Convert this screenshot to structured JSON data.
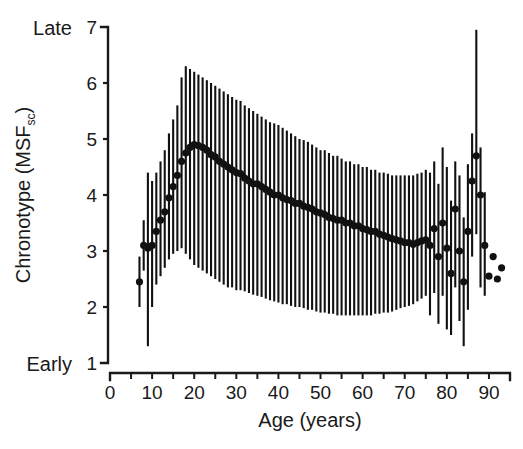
{
  "figure": {
    "background_color": "#ffffff",
    "ink_color": "#111111"
  },
  "axes": {
    "y": {
      "label_main": "Chronotype (MSF",
      "label_sub": "sc",
      "label_close": ")",
      "ticks": [
        1,
        2,
        3,
        4,
        5,
        6,
        7
      ],
      "tick_labels": [
        "1",
        "2",
        "3",
        "4",
        "5",
        "6",
        "7"
      ],
      "range": [
        1,
        7
      ],
      "end_label_high": "Late",
      "end_label_low": "Early"
    },
    "x": {
      "label": "Age (years)",
      "ticks": [
        0,
        10,
        20,
        30,
        40,
        50,
        60,
        70,
        80,
        90
      ],
      "tick_labels": [
        "0",
        "10",
        "20",
        "30",
        "40",
        "50",
        "60",
        "70",
        "80",
        "90"
      ],
      "minor_tick_step": 5,
      "range": [
        0,
        95
      ]
    }
  },
  "chart_data": {
    "type": "scatter",
    "title": "",
    "xlabel": "Age (years)",
    "ylabel": "Chronotype (MSFsc)",
    "xlim": [
      0,
      95
    ],
    "ylim": [
      1,
      7
    ],
    "grid": false,
    "legend": "none",
    "marker": "filled-circle",
    "error_bar_style": "vertical-line",
    "annotations": [
      "Late",
      "Early"
    ],
    "x": [
      7,
      8,
      9,
      10,
      11,
      12,
      13,
      14,
      15,
      16,
      17,
      18,
      19,
      20,
      21,
      22,
      23,
      24,
      25,
      26,
      27,
      28,
      29,
      30,
      31,
      32,
      33,
      34,
      35,
      36,
      37,
      38,
      39,
      40,
      41,
      42,
      43,
      44,
      45,
      46,
      47,
      48,
      49,
      50,
      51,
      52,
      53,
      54,
      55,
      56,
      57,
      58,
      59,
      60,
      61,
      62,
      63,
      64,
      65,
      66,
      67,
      68,
      69,
      70,
      71,
      72,
      73,
      74,
      75,
      76,
      77,
      78,
      79,
      80,
      81,
      82,
      83,
      84,
      85,
      86,
      87,
      88,
      89,
      90,
      91,
      92,
      93
    ],
    "y": [
      2.45,
      3.1,
      3.05,
      3.1,
      3.35,
      3.55,
      3.7,
      3.95,
      4.15,
      4.35,
      4.6,
      4.75,
      4.85,
      4.9,
      4.88,
      4.85,
      4.8,
      4.72,
      4.68,
      4.6,
      4.55,
      4.5,
      4.45,
      4.4,
      4.38,
      4.3,
      4.25,
      4.2,
      4.2,
      4.15,
      4.1,
      4.05,
      4.0,
      4.0,
      3.95,
      3.92,
      3.9,
      3.85,
      3.85,
      3.8,
      3.78,
      3.75,
      3.7,
      3.68,
      3.65,
      3.6,
      3.58,
      3.55,
      3.55,
      3.5,
      3.5,
      3.45,
      3.45,
      3.4,
      3.38,
      3.35,
      3.35,
      3.3,
      3.28,
      3.25,
      3.22,
      3.2,
      3.18,
      3.15,
      3.15,
      3.12,
      3.15,
      3.18,
      3.2,
      3.1,
      3.4,
      2.9,
      3.5,
      3.05,
      2.6,
      3.75,
      3.0,
      2.45,
      3.35,
      4.25,
      4.7,
      4.0,
      3.1,
      2.55,
      2.9,
      2.5,
      2.7
    ],
    "y_err_low": [
      2.0,
      2.65,
      1.3,
      2.0,
      2.4,
      2.55,
      2.7,
      2.85,
      2.95,
      3.0,
      3.05,
      2.95,
      2.85,
      2.75,
      2.7,
      2.65,
      2.6,
      2.55,
      2.5,
      2.45,
      2.4,
      2.35,
      2.35,
      2.3,
      2.3,
      2.28,
      2.25,
      2.22,
      2.2,
      2.18,
      2.15,
      2.12,
      2.1,
      2.08,
      2.05,
      2.05,
      2.02,
      2.0,
      2.0,
      1.98,
      1.95,
      1.95,
      1.92,
      1.9,
      1.9,
      1.88,
      1.88,
      1.85,
      1.85,
      1.85,
      1.85,
      1.85,
      1.85,
      1.85,
      1.85,
      1.85,
      1.88,
      1.88,
      1.9,
      1.9,
      1.92,
      1.95,
      1.98,
      2.0,
      2.02,
      2.05,
      2.1,
      2.15,
      2.2,
      1.85,
      2.25,
      1.7,
      2.2,
      1.6,
      1.5,
      2.35,
      1.75,
      1.3,
      1.95,
      2.9,
      3.3,
      2.35,
      2.2,
      null,
      null,
      null,
      null
    ],
    "y_err_high": [
      2.9,
      3.55,
      4.4,
      4.25,
      4.4,
      4.6,
      4.8,
      5.1,
      5.35,
      5.6,
      6.1,
      6.3,
      6.25,
      6.2,
      6.15,
      6.1,
      6.05,
      6.0,
      5.95,
      5.9,
      5.85,
      5.8,
      5.75,
      5.7,
      5.68,
      5.6,
      5.55,
      5.5,
      5.45,
      5.4,
      5.35,
      5.3,
      5.28,
      5.25,
      5.2,
      5.15,
      5.1,
      5.05,
      5.0,
      4.98,
      4.95,
      4.9,
      4.85,
      4.8,
      4.8,
      4.75,
      4.7,
      4.7,
      4.65,
      4.6,
      4.6,
      4.55,
      4.55,
      4.5,
      4.5,
      4.45,
      4.45,
      4.4,
      4.4,
      4.38,
      4.35,
      4.35,
      4.35,
      4.35,
      4.35,
      4.35,
      4.38,
      4.4,
      4.45,
      4.4,
      4.6,
      4.2,
      4.85,
      4.5,
      3.9,
      4.6,
      4.35,
      3.6,
      4.55,
      5.1,
      6.95,
      4.85,
      4.05,
      null,
      null,
      null,
      null
    ]
  }
}
